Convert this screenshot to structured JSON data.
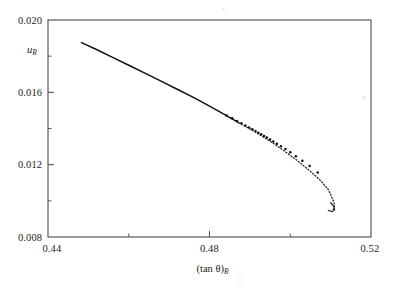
{
  "figure": {
    "background_color": "#ffffff",
    "frame_color": "#4a4a4a",
    "curve_color": "#111111"
  },
  "chart_data": {
    "type": "line",
    "title": "",
    "subtitle": "",
    "xlabel": "(tan θ)_R",
    "xlabel_base": "(tan θ)",
    "xlabel_sub": "R",
    "ylabel": "u_R",
    "ylabel_base": "u",
    "ylabel_sub": "R",
    "xlim": [
      0.44,
      0.52
    ],
    "ylim": [
      0.008,
      0.02
    ],
    "xticks": [
      0.44,
      0.48,
      0.52
    ],
    "xtick_labels": [
      "0.44",
      "0.48",
      "0.52"
    ],
    "xticks_minor": [
      0.46,
      0.5
    ],
    "yticks": [
      0.008,
      0.012,
      0.016,
      0.02
    ],
    "ytick_labels": [
      "0.008",
      "0.012",
      "0.016",
      "0.020"
    ],
    "yticks_minor": [
      0.01,
      0.014,
      0.018
    ],
    "grid": false,
    "legend": "none",
    "annotations": [],
    "series": [
      {
        "name": "solid-branch",
        "style": "solid",
        "x": [
          0.4483,
          0.452,
          0.456,
          0.46,
          0.464,
          0.468,
          0.472,
          0.476,
          0.48,
          0.484,
          0.4872
        ],
        "y": [
          0.01875,
          0.01837,
          0.01793,
          0.0175,
          0.01706,
          0.01662,
          0.01617,
          0.01572,
          0.01524,
          0.01474,
          0.01432
        ]
      },
      {
        "name": "dotted-branch",
        "style": "dotted",
        "x": [
          0.4872,
          0.49,
          0.493,
          0.496,
          0.499,
          0.502,
          0.505,
          0.5075,
          0.5095,
          0.5105,
          0.511,
          0.5106
        ],
        "y": [
          0.01432,
          0.01398,
          0.01358,
          0.01315,
          0.01268,
          0.01218,
          0.01163,
          0.01112,
          0.0106,
          0.0101,
          0.00975,
          0.00952
        ]
      }
    ],
    "markers": {
      "name": "data-points",
      "shape": "dot",
      "x": [
        0.4842,
        0.4856,
        0.4868,
        0.4879,
        0.4889,
        0.4898,
        0.4906,
        0.4914,
        0.4921,
        0.4928,
        0.4935,
        0.4942,
        0.495,
        0.4958,
        0.4967,
        0.4977,
        0.4988,
        0.5,
        0.5014,
        0.503,
        0.5048,
        0.5068
      ],
      "y": [
        0.01472,
        0.01456,
        0.01442,
        0.01429,
        0.01417,
        0.01406,
        0.01396,
        0.01386,
        0.01377,
        0.01368,
        0.01359,
        0.0135,
        0.01339,
        0.01328,
        0.01316,
        0.01302,
        0.01286,
        0.01268,
        0.01247,
        0.01222,
        0.01193,
        0.01157
      ]
    },
    "tail_hook": {
      "name": "tail-curl",
      "x": [
        0.51,
        0.5108,
        0.511,
        0.5104,
        0.5094
      ],
      "y": [
        0.0099,
        0.00968,
        0.0095,
        0.0094,
        0.00948
      ]
    }
  }
}
